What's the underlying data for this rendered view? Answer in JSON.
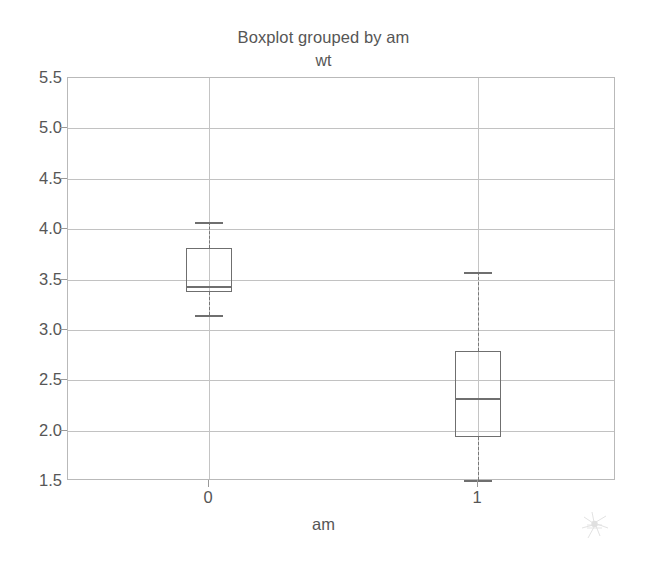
{
  "chart_data": {
    "type": "box",
    "title": "Boxplot grouped by am",
    "subtitle": "wt",
    "xlabel": "am",
    "ylabel": "",
    "categories": [
      "0",
      "1"
    ],
    "ylim": [
      1.5,
      5.5
    ],
    "yticks": [
      "5.5",
      "5.0",
      "4.5",
      "4.0",
      "3.5",
      "3.0",
      "2.5",
      "2.0",
      "1.5"
    ],
    "ytick_values": [
      5.5,
      5.0,
      4.5,
      4.0,
      3.5,
      3.0,
      2.5,
      2.0,
      1.5
    ],
    "grid": true,
    "legend": false,
    "boxes": [
      {
        "category": "0",
        "whisker_low": 3.15,
        "q1": 3.38,
        "median": 3.44,
        "q3": 3.81,
        "whisker_high": 4.07,
        "outliers": []
      },
      {
        "category": "1",
        "whisker_low": 1.51,
        "q1": 1.94,
        "median": 2.32,
        "q3": 2.79,
        "whisker_high": 3.57,
        "outliers": []
      }
    ]
  },
  "colors": {
    "box_outline": "#6f6f6f",
    "grid": "#c2c2c2",
    "axis": "#b9b9b9",
    "text": "#565656",
    "background": "#ffffff"
  }
}
